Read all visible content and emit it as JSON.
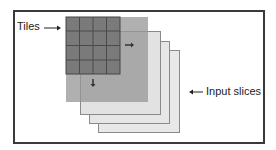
{
  "diagram": {
    "labels": {
      "tiles": "Tiles",
      "input_slices": "Input slices"
    },
    "colors": {
      "frame": "#3a3a3a",
      "tile_grid_fill": "#7d7d7d",
      "tile_grid_lines": "#4a4a4a",
      "layer1_fill": "#a9a9a9",
      "slice_fill": "#e6e6e6",
      "slice_border": "#8a8a8a",
      "arrow": "#333333"
    },
    "grid": {
      "rows": 4,
      "cols": 4
    },
    "slices_count": 4,
    "icons": [
      "arrow-right-icon",
      "arrow-down-icon",
      "arrow-left-icon"
    ]
  }
}
